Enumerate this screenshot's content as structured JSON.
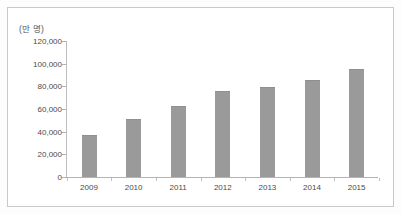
{
  "chart_data": {
    "type": "bar",
    "title": "",
    "subtitle": "",
    "unit_label": "(만 명)",
    "xlabel": "",
    "ylabel": "",
    "categories": [
      "2009",
      "2010",
      "2011",
      "2012",
      "2013",
      "2014",
      "2015"
    ],
    "values": [
      37000,
      51000,
      63000,
      75500,
      79500,
      86000,
      95000
    ],
    "ylim": [
      0,
      120000
    ],
    "ytick_values": [
      0,
      20000,
      40000,
      60000,
      80000,
      100000,
      120000
    ],
    "ytick_labels": [
      "0",
      "20,000",
      "40,000",
      "60,000",
      "80,000",
      "100,000",
      "120,000"
    ],
    "grid": false,
    "legend": null,
    "series": [
      {
        "name": "",
        "values": [
          37000,
          51000,
          63000,
          75500,
          79500,
          86000,
          95000
        ]
      }
    ],
    "colors": {
      "bar_fill": "#9a9a9a",
      "bar_edge": "#8f8f8f",
      "axis_line": "#b4b4b4",
      "tick_text": "#4a4a4a",
      "frame_border": "#c9c9c9",
      "background": "#ffffff"
    }
  }
}
